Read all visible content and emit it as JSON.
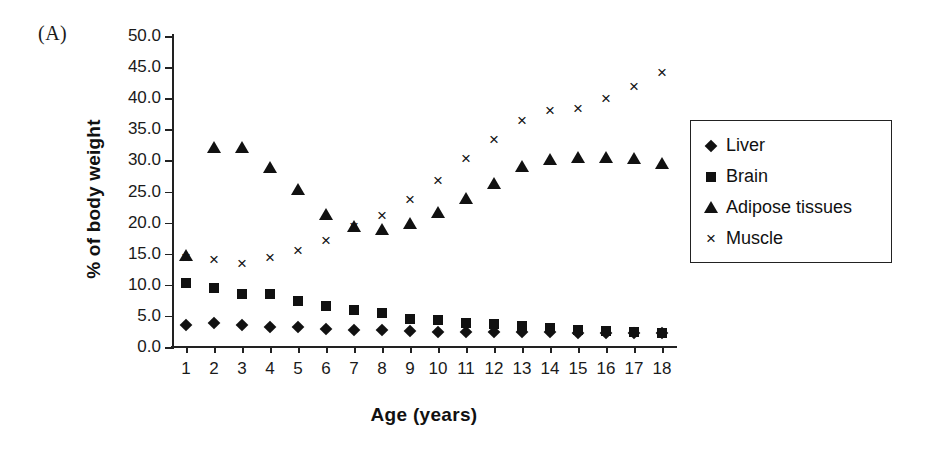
{
  "panel": {
    "label": "(A)"
  },
  "axes": {
    "ylabel": "% of body weight",
    "xlabel": "Age (years)"
  },
  "legend": {
    "items": [
      {
        "label": "Liver",
        "marker": "diamond-marker-icon"
      },
      {
        "label": "Brain",
        "marker": "square-marker-icon"
      },
      {
        "label": "Adipose tissues",
        "marker": "triangle-marker-icon"
      },
      {
        "label": "Muscle",
        "marker": "cross-marker-icon"
      }
    ]
  },
  "chart_data": {
    "type": "scatter",
    "title": "",
    "subtitle": "",
    "xlabel": "Age (years)",
    "ylabel": "% of body weight",
    "xlim": [
      0.5,
      18.5
    ],
    "ylim": [
      0.0,
      50.0
    ],
    "ytick_labels": [
      "0.0",
      "5.0",
      "10.0",
      "15.0",
      "20.0",
      "25.0",
      "30.0",
      "35.0",
      "40.0",
      "45.0",
      "50.0"
    ],
    "ytick_values": [
      0,
      5,
      10,
      15,
      20,
      25,
      30,
      35,
      40,
      45,
      50
    ],
    "xtick_labels": [
      "1",
      "2",
      "3",
      "4",
      "5",
      "6",
      "7",
      "8",
      "9",
      "10",
      "11",
      "12",
      "13",
      "14",
      "15",
      "16",
      "17",
      "18"
    ],
    "x": [
      1,
      2,
      3,
      4,
      5,
      6,
      7,
      8,
      9,
      10,
      11,
      12,
      13,
      14,
      15,
      16,
      17,
      18
    ],
    "grid": false,
    "legend_position": "right",
    "marker_color": "#111111",
    "series": [
      {
        "name": "Liver",
        "marker": "diamond",
        "values": [
          3.5,
          3.8,
          3.5,
          3.2,
          3.2,
          2.9,
          2.7,
          2.7,
          2.6,
          2.4,
          2.4,
          2.4,
          2.4,
          2.4,
          2.3,
          2.2,
          2.2,
          2.2
        ]
      },
      {
        "name": "Brain",
        "marker": "square",
        "values": [
          10.3,
          9.5,
          8.6,
          8.6,
          7.4,
          6.6,
          5.9,
          5.4,
          4.5,
          4.3,
          3.9,
          3.7,
          3.3,
          3.0,
          2.7,
          2.5,
          2.4,
          2.3
        ]
      },
      {
        "name": "Adipose tissues",
        "marker": "triangle",
        "values": [
          14.6,
          32.0,
          32.0,
          28.7,
          25.2,
          21.3,
          19.3,
          18.8,
          19.7,
          21.5,
          23.8,
          26.2,
          29.0,
          30.0,
          30.4,
          30.4,
          30.2,
          29.4
        ]
      },
      {
        "name": "Muscle",
        "marker": "cross",
        "values": [
          14.3,
          14.0,
          13.4,
          14.3,
          15.5,
          17.0,
          19.3,
          21.0,
          23.7,
          26.7,
          30.2,
          33.3,
          36.3,
          38.0,
          38.3,
          39.8,
          41.8,
          44.0
        ]
      }
    ]
  }
}
